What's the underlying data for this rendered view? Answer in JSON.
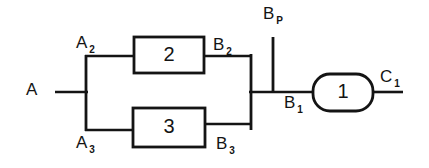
{
  "diagram": {
    "type": "block-diagram",
    "canvas": {
      "width": 429,
      "height": 168,
      "background": "#ffffff"
    },
    "line_color": "#141414",
    "blocks": [
      {
        "id": "block-2",
        "label": "2",
        "shape": "rectangle",
        "x": 134,
        "y": 37,
        "width": 70,
        "height": 36
      },
      {
        "id": "block-3",
        "label": "3",
        "shape": "rectangle",
        "x": 133,
        "y": 108,
        "width": 72,
        "height": 39
      },
      {
        "id": "block-1",
        "label": "1",
        "shape": "rounded-rectangle",
        "x": 313,
        "y": 74,
        "width": 60,
        "height": 37,
        "radius": 17
      }
    ],
    "ports": [
      {
        "id": "port-a",
        "base": "A",
        "subscript": ""
      },
      {
        "id": "port-a2",
        "base": "A",
        "subscript": "2"
      },
      {
        "id": "port-a3",
        "base": "A",
        "subscript": "3"
      },
      {
        "id": "port-b2",
        "base": "B",
        "subscript": "2"
      },
      {
        "id": "port-b3",
        "base": "B",
        "subscript": "3"
      },
      {
        "id": "port-bp",
        "base": "B",
        "subscript": "P"
      },
      {
        "id": "port-b1",
        "base": "B",
        "subscript": "1"
      },
      {
        "id": "port-c1",
        "base": "C",
        "subscript": "1"
      }
    ],
    "wires": {
      "input_stem": {
        "x1": 55,
        "y1": 92,
        "x2": 88,
        "y2": 92
      },
      "left_bus": {
        "x1": 86,
        "y1": 56,
        "x2": 86,
        "y2": 131
      },
      "upper_in_branch": {
        "x1": 86,
        "y1": 56,
        "x2": 135,
        "y2": 56
      },
      "lower_in_branch": {
        "x1": 86,
        "y1": 130,
        "x2": 134,
        "y2": 130
      },
      "upper_out_branch": {
        "x1": 204,
        "y1": 56,
        "x2": 252,
        "y2": 56
      },
      "lower_out_branch": {
        "x1": 205,
        "y1": 124,
        "x2": 252,
        "y2": 124
      },
      "right_bus": {
        "x1": 251,
        "y1": 55,
        "x2": 251,
        "y2": 130
      },
      "main_stem": {
        "x1": 249,
        "y1": 92,
        "x2": 314,
        "y2": 92
      },
      "bypass_terminal": {
        "x1": 273,
        "y1": 37,
        "x2": 273,
        "y2": 93
      },
      "output_stem": {
        "x1": 372,
        "y1": 92,
        "x2": 403,
        "y2": 92
      }
    }
  }
}
